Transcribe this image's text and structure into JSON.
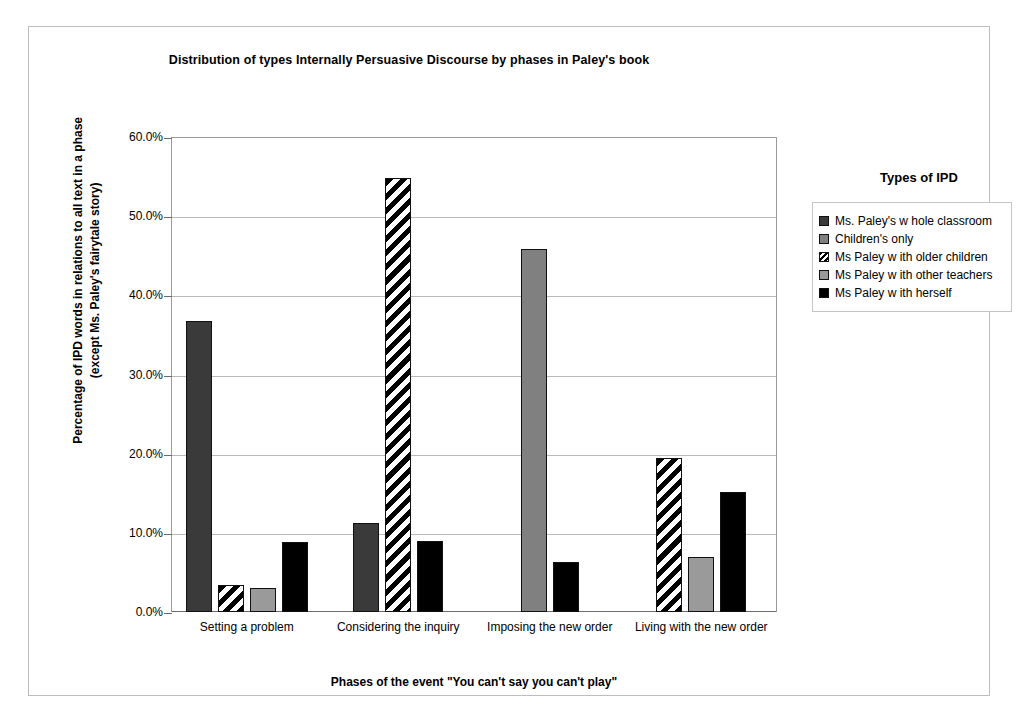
{
  "chart_data": {
    "type": "bar",
    "title": "Distribution of types Internally Persuasive Discourse by phases in Paley's book",
    "xlabel": "Phases of the event \"You can't say you can't play\"",
    "ylabel": "Percentage of IPD words in relations to all text in a phase (except Ms. Paley's fairytale story)",
    "ylabel_line1": "Percentage of IPD words in relations to all text in a phase",
    "ylabel_line2": "(except Ms. Paley's fairytale story)",
    "categories": [
      "Setting a problem",
      "Considering the inquiry",
      "Imposing the new order",
      "Living with the new order"
    ],
    "ylim": [
      0,
      60
    ],
    "ytick_labels": [
      "0.0%",
      "10.0%",
      "20.0%",
      "30.0%",
      "40.0%",
      "50.0%",
      "60.0%"
    ],
    "ytick_values": [
      0,
      10,
      20,
      30,
      40,
      50,
      60
    ],
    "grid": true,
    "legend_position": "right",
    "legend_title": "Types of IPD",
    "series": [
      {
        "name": "Ms. Paley's w hole classroom",
        "key": "s1",
        "color": "#3a3a3a",
        "pattern": "solid",
        "values": [
          36.7,
          11.2,
          null,
          null
        ]
      },
      {
        "name": "Children's only",
        "key": "s2",
        "color": "#808080",
        "pattern": "solid",
        "values": [
          null,
          null,
          45.9,
          null
        ]
      },
      {
        "name": "Ms Paley w ith older children",
        "key": "s3",
        "color": "#ffffff",
        "pattern": "diagonal-hatch",
        "values": [
          3.4,
          54.8,
          null,
          19.5
        ]
      },
      {
        "name": "Ms Paley w ith other teachers",
        "key": "s4",
        "color": "#9a9a9a",
        "pattern": "solid",
        "values": [
          3.0,
          null,
          null,
          7.0
        ]
      },
      {
        "name": "Ms Paley w ith herself",
        "key": "s5",
        "color": "#000000",
        "pattern": "solid",
        "values": [
          8.9,
          9.0,
          6.3,
          15.2
        ]
      }
    ]
  }
}
